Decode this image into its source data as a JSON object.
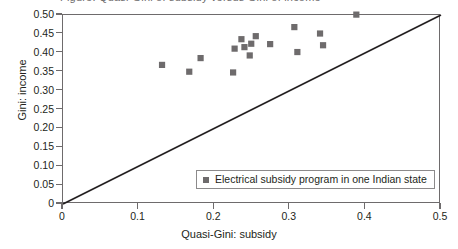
{
  "title": {
    "text": "Figure: Quasi-Gini of subsidy versus Gini of income",
    "visible_fragment": true
  },
  "chart_data": {
    "type": "scatter",
    "title": "",
    "xlabel": "Quasi-Gini: subsidy",
    "ylabel": "Gini: income",
    "xlim": [
      0,
      0.5
    ],
    "ylim": [
      0,
      0.5
    ],
    "grid": false,
    "legend_position": "inside-bottom-right",
    "marker": "square",
    "marker_color": "#6e6b6c",
    "x_ticks": [
      "0",
      "0.1",
      "0.2",
      "0.3",
      "0.4",
      "0.5"
    ],
    "x_tick_values": [
      0,
      0.1,
      0.2,
      0.3,
      0.4,
      0.5
    ],
    "y_ticks": [
      "0",
      "0.05",
      "0.10",
      "0.15",
      "0.20",
      "0.25",
      "0.30",
      "0.35",
      "0.40",
      "0.45",
      "0.50"
    ],
    "y_tick_values": [
      0,
      0.05,
      0.1,
      0.15,
      0.2,
      0.25,
      0.3,
      0.35,
      0.4,
      0.45,
      0.5
    ],
    "series": [
      {
        "name": "Electrical subsidy program in one Indian state",
        "points": [
          {
            "x": 0.131,
            "y": 0.368
          },
          {
            "x": 0.167,
            "y": 0.35
          },
          {
            "x": 0.182,
            "y": 0.386
          },
          {
            "x": 0.225,
            "y": 0.348
          },
          {
            "x": 0.227,
            "y": 0.411
          },
          {
            "x": 0.236,
            "y": 0.436
          },
          {
            "x": 0.24,
            "y": 0.415
          },
          {
            "x": 0.247,
            "y": 0.393
          },
          {
            "x": 0.249,
            "y": 0.424
          },
          {
            "x": 0.255,
            "y": 0.444
          },
          {
            "x": 0.274,
            "y": 0.423
          },
          {
            "x": 0.306,
            "y": 0.468
          },
          {
            "x": 0.31,
            "y": 0.402
          },
          {
            "x": 0.34,
            "y": 0.451
          },
          {
            "x": 0.344,
            "y": 0.42
          },
          {
            "x": 0.388,
            "y": 0.501
          }
        ]
      }
    ],
    "reference_line": {
      "name": "45-degree equality line",
      "from": {
        "x": 0,
        "y": 0
      },
      "to": {
        "x": 0.5,
        "y": 0.5
      },
      "color": "#231f20"
    }
  },
  "legend": {
    "entries": [
      {
        "label": "Electrical subsidy program in one Indian state",
        "color": "#6e6b6c",
        "marker": "square"
      }
    ]
  },
  "colors": {
    "marker": "#6e6b6c",
    "axis": "#6e6b6c",
    "line": "#231f20",
    "text": "#231f20",
    "background": "#ffffff"
  }
}
